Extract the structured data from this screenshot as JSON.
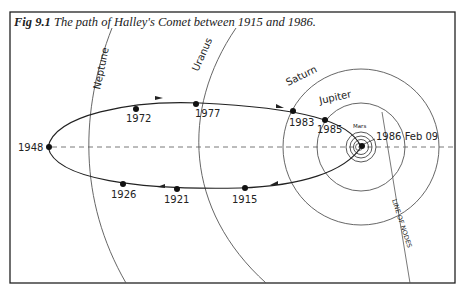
{
  "figure": {
    "label": "Fig 9.1",
    "title": "The path of Halley's Comet between 1915 and 1986."
  },
  "planets": [
    {
      "name": "Neptune"
    },
    {
      "name": "Uranus"
    },
    {
      "name": "Saturn"
    },
    {
      "name": "Jupiter"
    },
    {
      "name": "Mars"
    }
  ],
  "comet_positions": [
    {
      "year": "1915"
    },
    {
      "year": "1921"
    },
    {
      "year": "1926"
    },
    {
      "year": "1948"
    },
    {
      "year": "1972"
    },
    {
      "year": "1977"
    },
    {
      "year": "1983"
    },
    {
      "year": "1985"
    },
    {
      "year": "1986 Feb 09"
    }
  ],
  "annotations": {
    "line_of_nodes": "LINE OF NODES"
  },
  "colors": {
    "ink": "#222222",
    "orbit": "#555555",
    "background": "#ffffff"
  }
}
